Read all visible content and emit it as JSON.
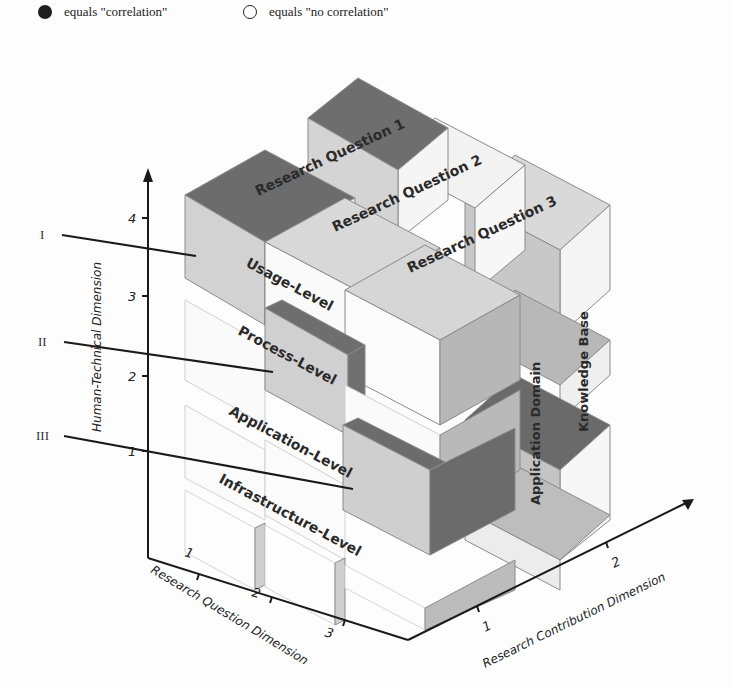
{
  "legend": {
    "items": [
      {
        "symbol": "filled-circle",
        "label": "equals \"correlation\""
      },
      {
        "symbol": "empty-circle",
        "label": "equals \"no correlation\""
      }
    ]
  },
  "pointers": [
    {
      "label": "I",
      "target": "Usage-Level"
    },
    {
      "label": "II",
      "target": "Process-Level"
    },
    {
      "label": "III",
      "target": "Infrastructure-Level"
    }
  ],
  "axes": {
    "vertical": {
      "title": "Human-Technical Dimension",
      "ticks": [
        "1",
        "2",
        "3",
        "4"
      ]
    },
    "left": {
      "title": "Research Question Dimension",
      "ticks": [
        "1",
        "2",
        "3"
      ]
    },
    "right": {
      "title": "Research Contribution Dimension",
      "ticks": [
        "1",
        "2"
      ]
    }
  },
  "levels": [
    "Usage-Level",
    "Process-Level",
    "Application-Level",
    "Infrastructure-Level"
  ],
  "research_questions": [
    "Research Question 1",
    "Research Question 2",
    "Research Question 3"
  ],
  "contributions": [
    "Application Domain",
    "Knowledge Base"
  ],
  "colors": {
    "dark": "#6e6e6e",
    "mid": "#b4b4b4",
    "light": "#d6d6d6",
    "pale": "#ececec",
    "edge": "#555555",
    "axis": "#1a1a1a"
  }
}
